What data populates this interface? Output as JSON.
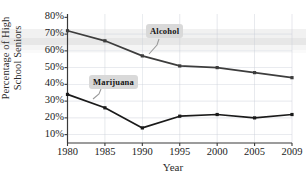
{
  "chart_data": {
    "type": "line",
    "title": "",
    "xlabel": "Year",
    "ylabel_line1": "Percentage of High",
    "ylabel_line2": "School Seniors",
    "x": [
      1980,
      1985,
      1990,
      1995,
      2000,
      2005,
      2009
    ],
    "xtick_labels": [
      "1980",
      "1985",
      "1990",
      "1995",
      "2000",
      "2005",
      "2009"
    ],
    "ytick_labels": [
      "80%",
      "70%",
      "60%",
      "50%",
      "40%",
      "30%",
      "20%",
      "10%"
    ],
    "ytick_values": [
      80,
      70,
      60,
      50,
      40,
      30,
      20,
      10
    ],
    "ylim": [
      5,
      82
    ],
    "grid": true,
    "legend_position": "inline-annotations",
    "series": [
      {
        "name": "Alcohol",
        "values": [
          72,
          66,
          57,
          51,
          50,
          47,
          44
        ],
        "color": "#3d3d3d",
        "annotation": "Alcohol"
      },
      {
        "name": "Marijuana",
        "values": [
          34,
          26,
          14,
          21,
          22,
          20,
          22
        ],
        "color": "#1a1a1a",
        "annotation": "Marijuana"
      }
    ],
    "annotations": [
      {
        "label": "Alcohol",
        "points_to_series": "Alcohol"
      },
      {
        "label": "Marijuana",
        "points_to_series": "Marijuana"
      }
    ],
    "colors": {
      "axis": "#3a3a3a",
      "grid": "#c9cfd8",
      "line": "#3d3d3d",
      "callout_background": "#d9d9d9",
      "text": "#1c1c1c",
      "background": "#ffffff"
    }
  }
}
